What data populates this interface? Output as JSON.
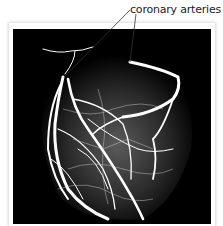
{
  "figure": {
    "label": "coronary arteries",
    "image_alt": "angiogram of heart showing coronary arteries",
    "colors": {
      "background": "#ffffff",
      "image_bg": "#000000",
      "vessels": "#ffffff",
      "leader_line": "#333333"
    }
  }
}
